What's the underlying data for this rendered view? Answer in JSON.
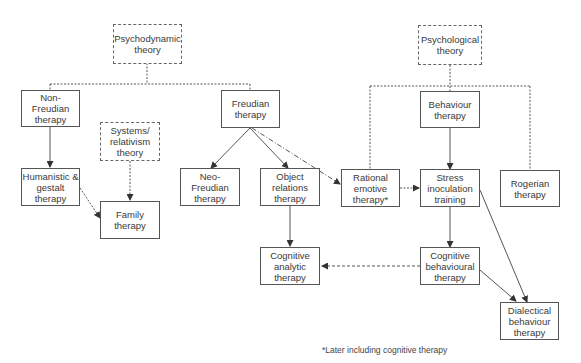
{
  "diagram": {
    "nodes": {
      "psychodynamic": {
        "label": "Psychodynamic\ntheory",
        "style": "dotted"
      },
      "psychological": {
        "label": "Psychological\ntheory",
        "style": "dotted"
      },
      "non_freudian": {
        "label": "Non-Freudian\ntherapy",
        "style": "solid"
      },
      "freudian": {
        "label": "Freudian\ntherapy",
        "style": "solid"
      },
      "behaviour": {
        "label": "Behaviour\ntherapy",
        "style": "solid"
      },
      "systems": {
        "label": "Systems/\nrelativism\ntheory",
        "style": "dotted"
      },
      "humanistic": {
        "label": "Humanistic &\ngestalt\ntherapy",
        "style": "solid"
      },
      "family": {
        "label": "Family\ntherapy",
        "style": "solid"
      },
      "neo_freudian": {
        "label": "Neo-Freudian\ntherapy",
        "style": "solid"
      },
      "object_relations": {
        "label": "Object\nrelations\ntherapy",
        "style": "solid"
      },
      "rational_emotive": {
        "label": "Rational\nemotive\ntherapy*",
        "style": "solid"
      },
      "stress_inoculation": {
        "label": "Stress\ninoculation\ntraining",
        "style": "solid"
      },
      "rogerian": {
        "label": "Rogerian\ntherapy",
        "style": "solid"
      },
      "cognitive_analytic": {
        "label": "Cognitive\nanalytic\ntherapy",
        "style": "solid"
      },
      "cbt": {
        "label": "Cognitive\nbehavioural\ntherapy",
        "style": "solid"
      },
      "dialectical": {
        "label": "Dialectical\nbehaviour\ntherapy",
        "style": "solid"
      }
    },
    "edges": [
      {
        "from": "psychodynamic",
        "to": "non_freudian",
        "style": "dotted",
        "arrow": false
      },
      {
        "from": "psychodynamic",
        "to": "freudian",
        "style": "dotted",
        "arrow": false
      },
      {
        "from": "psychological",
        "to": "behaviour",
        "style": "dotted",
        "arrow": false
      },
      {
        "from": "psychological",
        "to": "rational_emotive",
        "style": "dotted",
        "arrow": false
      },
      {
        "from": "psychological",
        "to": "rogerian",
        "style": "dotted",
        "arrow": false
      },
      {
        "from": "non_freudian",
        "to": "humanistic",
        "style": "solid",
        "arrow": true
      },
      {
        "from": "systems",
        "to": "family",
        "style": "dotted",
        "arrow": true
      },
      {
        "from": "humanistic",
        "to": "family",
        "style": "dotted",
        "arrow": true
      },
      {
        "from": "freudian",
        "to": "neo_freudian",
        "style": "solid",
        "arrow": true
      },
      {
        "from": "freudian",
        "to": "object_relations",
        "style": "solid",
        "arrow": true
      },
      {
        "from": "freudian",
        "to": "rational_emotive",
        "style": "dash-dot",
        "arrow": true
      },
      {
        "from": "rational_emotive",
        "to": "stress_inoculation",
        "style": "dotted",
        "arrow": true
      },
      {
        "from": "behaviour",
        "to": "stress_inoculation",
        "style": "solid",
        "arrow": true
      },
      {
        "from": "object_relations",
        "to": "cognitive_analytic",
        "style": "solid",
        "arrow": true
      },
      {
        "from": "stress_inoculation",
        "to": "cbt",
        "style": "solid",
        "arrow": true
      },
      {
        "from": "cbt",
        "to": "cognitive_analytic",
        "style": "dotted",
        "arrow": true
      },
      {
        "from": "cbt",
        "to": "dialectical",
        "style": "solid",
        "arrow": true
      },
      {
        "from": "stress_inoculation",
        "to": "dialectical",
        "style": "solid",
        "arrow": true
      }
    ],
    "footnote": "*Later including cognitive therapy"
  }
}
